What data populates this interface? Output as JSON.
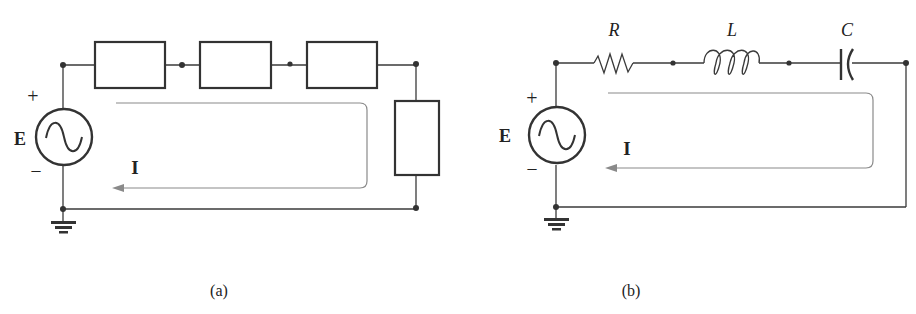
{
  "figure": {
    "panel_a": {
      "caption": "(a)",
      "source_label": "E",
      "plus_sign": "+",
      "minus_sign": "–",
      "current_label": "I",
      "series_blocks": 3,
      "shunt_blocks": 1
    },
    "panel_b": {
      "caption": "(b)",
      "source_label": "E",
      "plus_sign": "+",
      "minus_sign": "–",
      "current_label": "I",
      "components": [
        {
          "symbol": "resistor",
          "label": "R"
        },
        {
          "symbol": "inductor",
          "label": "L"
        },
        {
          "symbol": "capacitor",
          "label": "C"
        }
      ]
    },
    "colors": {
      "wire": "#3a3a3a",
      "current_arrow": "#8a8a8a"
    }
  }
}
